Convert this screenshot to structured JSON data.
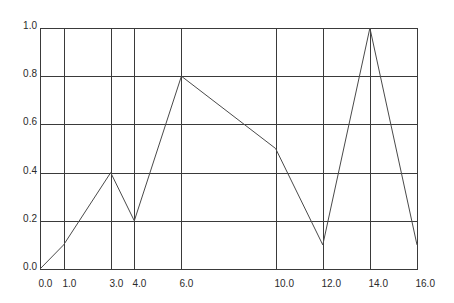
{
  "chart_data": {
    "type": "line",
    "title": "",
    "xlabel": "",
    "ylabel": "",
    "x": [
      0.0,
      1.0,
      3.0,
      4.0,
      6.0,
      10.0,
      12.0,
      14.0,
      16.0
    ],
    "series": [
      {
        "name": "series-1",
        "values": [
          0.0,
          0.1,
          0.4,
          0.2,
          0.8,
          0.5,
          0.1,
          1.0,
          0.1
        ]
      }
    ],
    "xlim": [
      0,
      16
    ],
    "ylim": [
      0,
      1.0
    ],
    "x_tick_labels": [
      "0.0",
      "1.0",
      "3.0",
      "4.0",
      "6.0",
      "10.0",
      "12.0",
      "14.0",
      "16.0"
    ],
    "x_ticks": [
      0,
      1,
      3,
      4,
      6,
      10,
      12,
      14,
      16
    ],
    "y_tick_labels": [
      "0.0",
      "0.2",
      "0.4",
      "0.6",
      "0.8",
      "1.0"
    ],
    "y_ticks": [
      0.0,
      0.2,
      0.4,
      0.6,
      0.8,
      1.0
    ],
    "grid": true,
    "legend": null,
    "colors": {
      "line": "#4a4a4a",
      "grid": "#3a3a3a",
      "background": "#ffffff"
    }
  },
  "layout": {
    "plot_left": 40,
    "plot_right": 417,
    "plot_top": 28,
    "plot_bottom": 269
  }
}
